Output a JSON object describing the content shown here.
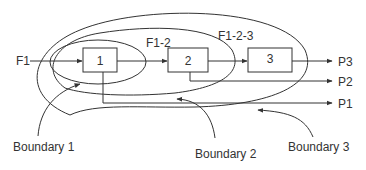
{
  "diagram": {
    "inputs": [
      {
        "label": "F1"
      }
    ],
    "processes": [
      {
        "label": "1"
      },
      {
        "label": "2"
      },
      {
        "label": "3"
      }
    ],
    "outputs": [
      {
        "label": "P3"
      },
      {
        "label": "P2"
      },
      {
        "label": "P1"
      }
    ],
    "flow_groups": [
      {
        "label": "F1-2"
      },
      {
        "label": "F1-2-3"
      }
    ],
    "boundaries": [
      {
        "label": "Boundary 1"
      },
      {
        "label": "Boundary 2"
      },
      {
        "label": "Boundary 3"
      }
    ],
    "colors": {
      "stroke": "#333333",
      "background": "#ffffff"
    }
  }
}
